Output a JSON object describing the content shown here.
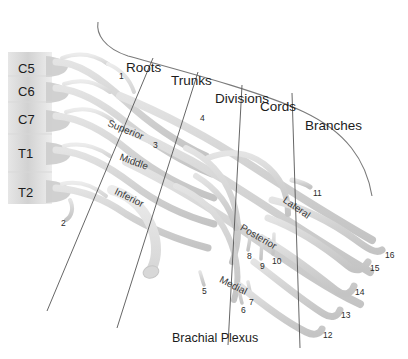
{
  "figure": {
    "caption": "Brachial Plexus",
    "background_color": "#ffffff",
    "nerve_color": "#d4d4d4",
    "nerve_stroke_color": "#bcbcbc",
    "bone_color": "#dcdcdc",
    "divider_color": "#555555",
    "text_color": "#1c1c1c"
  },
  "vertebrae": [
    {
      "label": "C5",
      "x": 18,
      "y": 62
    },
    {
      "label": "C6",
      "x": 18,
      "y": 85
    },
    {
      "label": "C7",
      "x": 18,
      "y": 113
    },
    {
      "label": "T1",
      "x": 18,
      "y": 147
    },
    {
      "label": "T2",
      "x": 18,
      "y": 186
    }
  ],
  "sections": [
    {
      "label": "Roots",
      "x": 126,
      "y": 61
    },
    {
      "label": "Trunks",
      "x": 171,
      "y": 74
    },
    {
      "label": "Divisions",
      "x": 215,
      "y": 92
    },
    {
      "label": "Cords",
      "x": 260,
      "y": 100
    },
    {
      "label": "Branches",
      "x": 305,
      "y": 119
    }
  ],
  "section_dividers": [
    {
      "name": "roots-trunks-divider",
      "x1": 153,
      "y1": 58,
      "x2": 47,
      "y2": 311
    },
    {
      "name": "trunks-divisions-divider",
      "x1": 198,
      "y1": 72,
      "x2": 117,
      "y2": 328
    },
    {
      "name": "divisions-cords-divider",
      "x1": 242,
      "y1": 85,
      "x2": 228,
      "y2": 345
    },
    {
      "name": "cords-branches-divider",
      "x1": 292,
      "y1": 93,
      "x2": 300,
      "y2": 348
    }
  ],
  "structures": [
    {
      "label": "Superior",
      "x": 108,
      "y": 118,
      "rotate": 22
    },
    {
      "label": "Middle",
      "x": 120,
      "y": 152,
      "rotate": 20
    },
    {
      "label": "Inferior",
      "x": 115,
      "y": 186,
      "rotate": 26
    },
    {
      "label": "Lateral",
      "x": 284,
      "y": 194,
      "rotate": 35
    },
    {
      "label": "Posterior",
      "x": 241,
      "y": 222,
      "rotate": 30
    },
    {
      "label": "Medial",
      "x": 220,
      "y": 274,
      "rotate": 27
    }
  ],
  "numbered_markers": [
    {
      "n": "1",
      "x": 119,
      "y": 72
    },
    {
      "n": "2",
      "x": 61,
      "y": 219
    },
    {
      "n": "3",
      "x": 153,
      "y": 141
    },
    {
      "n": "4",
      "x": 200,
      "y": 114
    },
    {
      "n": "5",
      "x": 202,
      "y": 287
    },
    {
      "n": "6",
      "x": 241,
      "y": 306
    },
    {
      "n": "7",
      "x": 249,
      "y": 298
    },
    {
      "n": "8",
      "x": 247,
      "y": 252
    },
    {
      "n": "9",
      "x": 260,
      "y": 262
    },
    {
      "n": "10",
      "x": 272,
      "y": 257
    },
    {
      "n": "11",
      "x": 313,
      "y": 189
    },
    {
      "n": "12",
      "x": 323,
      "y": 331
    },
    {
      "n": "13",
      "x": 341,
      "y": 311
    },
    {
      "n": "14",
      "x": 355,
      "y": 288
    },
    {
      "n": "15",
      "x": 370,
      "y": 264
    },
    {
      "n": "16",
      "x": 385,
      "y": 251
    }
  ]
}
